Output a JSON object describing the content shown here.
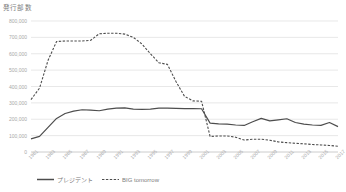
{
  "chart_data": {
    "type": "line",
    "title": "発行部数",
    "xlabel": "",
    "ylabel": "",
    "ylim": [
      0,
      800000
    ],
    "ytick_labels": [
      "800,000",
      "700,000",
      "600,000",
      "500,000",
      "400,000",
      "300,000",
      "200,000",
      "100,000",
      "0"
    ],
    "ytick_values": [
      800000,
      700000,
      600000,
      500000,
      400000,
      300000,
      200000,
      100000,
      0
    ],
    "grid": true,
    "legend_position": "bottom",
    "x": [
      1981,
      1982,
      1983,
      1984,
      1985,
      1986,
      1987,
      1988,
      1989,
      1990,
      1991,
      1992,
      1993,
      1994,
      1995,
      1996,
      1997,
      1998,
      1999,
      2000,
      2001,
      2002,
      2003,
      2004,
      2005,
      2006,
      2007,
      2008,
      2009,
      2010,
      2011,
      2012,
      2013,
      2014,
      2015,
      2016,
      2017
    ],
    "xtick_labels": [
      "1981",
      "1983",
      "1985",
      "1987",
      "1989",
      "1991",
      "1993",
      "1995",
      "1997",
      "1999",
      "2001",
      "2003",
      "2005",
      "2007",
      "2009",
      "2011",
      "2013",
      "2015",
      "2017"
    ],
    "series": [
      {
        "name": "プレジデント",
        "style": "solid",
        "color": "#4d4d4d",
        "values": [
          80000,
          95000,
          150000,
          205000,
          235000,
          250000,
          258000,
          256000,
          252000,
          262000,
          268000,
          270000,
          262000,
          260000,
          262000,
          268000,
          268000,
          266000,
          265000,
          265000,
          264000,
          176000,
          172000,
          170000,
          165000,
          162000,
          185000,
          205000,
          190000,
          196000,
          203000,
          180000,
          170000,
          165000,
          163000,
          180000,
          155000
        ]
      },
      {
        "name": "BIG tomorrow",
        "style": "dashed",
        "color": "#4d4d4d",
        "values": [
          320000,
          390000,
          560000,
          675000,
          678000,
          678000,
          678000,
          682000,
          722000,
          725000,
          725000,
          720000,
          700000,
          660000,
          600000,
          545000,
          535000,
          430000,
          340000,
          312000,
          310000,
          95000,
          98000,
          98000,
          90000,
          73000,
          78000,
          78000,
          72000,
          62000,
          57000,
          53000,
          50000,
          46000,
          43000,
          40000,
          35000
        ]
      }
    ]
  },
  "legend": {
    "items": [
      {
        "label": "プレジデント",
        "style": "solid"
      },
      {
        "label": "BIG tomorrow",
        "style": "dashed"
      }
    ]
  },
  "colors": {
    "grid": "#d9d9d9",
    "axis": "#bfbfbf",
    "line": "#4d4d4d",
    "label_text": "#a8a8a8",
    "title_text": "#7d7d7d"
  }
}
